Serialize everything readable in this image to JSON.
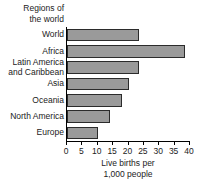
{
  "chart_data": {
    "type": "bar",
    "orientation": "horizontal",
    "title": "",
    "ylabel": "Regions of the world",
    "ylabel_lines": [
      "Regions of",
      "the world"
    ],
    "xlabel": "Live births per 1,000 people",
    "xlabel_lines": [
      "Live births per",
      "1,000 people"
    ],
    "categories": [
      "World",
      "Africa",
      "Latin America and Caribbean",
      "Asia",
      "Oceania",
      "North America",
      "Europe"
    ],
    "category_lines": [
      [
        "World"
      ],
      [
        "Africa"
      ],
      [
        "Latin America",
        "and Caribbean"
      ],
      [
        "Asia"
      ],
      [
        "Oceania"
      ],
      [
        "North America"
      ],
      [
        "Europe"
      ]
    ],
    "values": [
      23.5,
      38.5,
      23.5,
      20,
      18,
      14,
      10
    ],
    "xlim": [
      0,
      40
    ],
    "xticks": [
      0,
      5,
      10,
      15,
      20,
      25,
      30,
      35,
      40
    ],
    "xtick_labels": [
      "0",
      "5",
      "10",
      "15",
      "20",
      "25",
      "30",
      "35",
      "40"
    ],
    "grid": false,
    "legend": false,
    "bar_color": "#9a9a9a",
    "bar_edge_color": "#2b2b2b",
    "axis_color": "#000000",
    "background": "#ffffff"
  }
}
